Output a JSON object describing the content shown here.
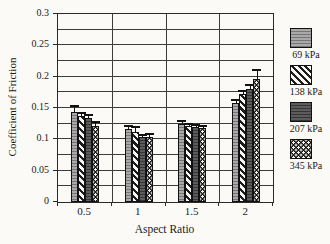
{
  "figure": {
    "background_color": "#fbfaf6",
    "axis_color": "#2a2a2a",
    "grid_color": "#3c3c3c"
  },
  "chart_data": {
    "type": "bar",
    "title": "",
    "xlabel": "Aspect Ratio",
    "ylabel": "Coefficient of Friction",
    "categories": [
      "0.5",
      "1",
      "1.5",
      "2"
    ],
    "y_ticks": [
      "0",
      "0.05",
      "0.1",
      "0.15",
      "0.2",
      "0.25",
      "0.3"
    ],
    "ylim": [
      0,
      0.3
    ],
    "grid_minor_step": 0.025,
    "grid": "on",
    "legend_position": "right",
    "error_bars": "upper",
    "series": [
      {
        "name": "69 kPa",
        "pattern": "gray-horizontal-lines",
        "values": [
          0.144,
          0.116,
          0.124,
          0.158
        ],
        "errors_plus": [
          0.009,
          0.006,
          0.006,
          0.005
        ]
      },
      {
        "name": "138 kPa",
        "pattern": "black-diagonal-stripes-on-white",
        "values": [
          0.138,
          0.111,
          0.121,
          0.173
        ],
        "errors_plus": [
          0.004,
          0.009,
          0.004,
          0.004
        ]
      },
      {
        "name": "207 kPa",
        "pattern": "dark-gray-horizontal-lines",
        "values": [
          0.134,
          0.104,
          0.12,
          0.18
        ],
        "errors_plus": [
          0.005,
          0.003,
          0.003,
          0.006
        ]
      },
      {
        "name": "345 kPa",
        "pattern": "white-dots-on-black",
        "values": [
          0.122,
          0.103,
          0.118,
          0.196
        ],
        "errors_plus": [
          0.005,
          0.005,
          0.004,
          0.014
        ]
      }
    ]
  }
}
